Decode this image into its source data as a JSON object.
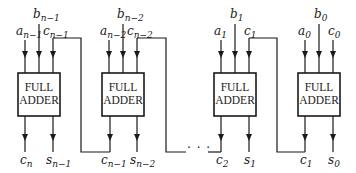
{
  "diagram": {
    "type": "ripple-carry-adder",
    "stages": [
      {
        "label_line1": "FULL",
        "label_line2": "ADDER",
        "inputs": {
          "a": {
            "base": "a",
            "sub": "n−1"
          },
          "b": {
            "base": "b",
            "sub": "n−1"
          },
          "c": {
            "base": "c",
            "sub": "n−1"
          }
        },
        "outputs": {
          "c": {
            "base": "c",
            "sub": "n"
          },
          "s": {
            "base": "s",
            "sub": "n−1"
          }
        }
      },
      {
        "label_line1": "FULL",
        "label_line2": "ADDER",
        "inputs": {
          "a": {
            "base": "a",
            "sub": "n−2"
          },
          "b": {
            "base": "b",
            "sub": "n−2"
          },
          "c": {
            "base": "c",
            "sub": "n−2"
          }
        },
        "outputs": {
          "c": {
            "base": "c",
            "sub": "n−1"
          },
          "s": {
            "base": "s",
            "sub": "n−2"
          }
        }
      },
      {
        "label_line1": "FULL",
        "label_line2": "ADDER",
        "inputs": {
          "a": {
            "base": "a",
            "sub": "1"
          },
          "b": {
            "base": "b",
            "sub": "1"
          },
          "c": {
            "base": "c",
            "sub": "1"
          }
        },
        "outputs": {
          "c": {
            "base": "c",
            "sub": "2"
          },
          "s": {
            "base": "s",
            "sub": "1"
          }
        }
      },
      {
        "label_line1": "FULL",
        "label_line2": "ADDER",
        "inputs": {
          "a": {
            "base": "a",
            "sub": "0"
          },
          "b": {
            "base": "b",
            "sub": "0"
          },
          "c": {
            "base": "c",
            "sub": "0"
          }
        },
        "outputs": {
          "c": {
            "base": "c",
            "sub": "1"
          },
          "s": {
            "base": "s",
            "sub": "0"
          }
        }
      }
    ],
    "ellipsis": "· · ·"
  }
}
